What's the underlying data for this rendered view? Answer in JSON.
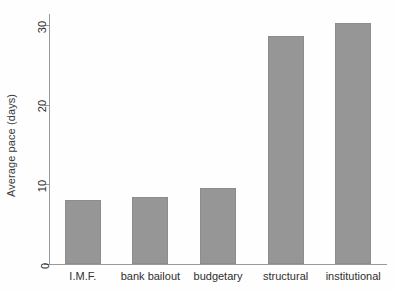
{
  "chart_data": {
    "type": "bar",
    "title": "",
    "xlabel": "",
    "ylabel": "Average pace (days)",
    "categories": [
      "I.M.F.",
      "bank bailout",
      "budgetary",
      "structural",
      "institutional"
    ],
    "values": [
      8.1,
      8.4,
      9.5,
      28.6,
      30.3
    ],
    "ylim": [
      0,
      31.4
    ],
    "yticks": [
      0,
      10,
      20,
      30
    ],
    "ytick_labels": [
      "0",
      "10",
      "20",
      "30"
    ],
    "grid": false,
    "legend": false,
    "legend_position": "none",
    "bar_color": "#969696",
    "axis_color": "#9a9a9a",
    "text_color": "#2e2e2e",
    "background_color": "#fefefe"
  },
  "figure": {
    "y_axis_title": "Average pace (days)"
  }
}
